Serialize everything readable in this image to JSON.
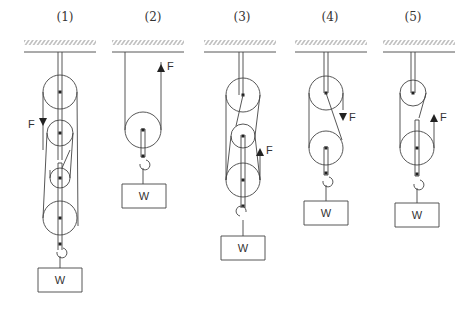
{
  "figure": {
    "type": "pulley-systems",
    "panels": [
      {
        "label": "(1)",
        "force_label": "F",
        "force_direction": "down",
        "weight_label": "W",
        "pulleys": 4
      },
      {
        "label": "(2)",
        "force_label": "F",
        "force_direction": "up",
        "weight_label": "W",
        "pulleys": 1
      },
      {
        "label": "(3)",
        "force_label": "F",
        "force_direction": "up",
        "weight_label": "W",
        "pulleys": 3
      },
      {
        "label": "(4)",
        "force_label": "F",
        "force_direction": "down",
        "weight_label": "W",
        "pulleys": 2
      },
      {
        "label": "(5)",
        "force_label": "F",
        "force_direction": "up",
        "weight_label": "W",
        "pulleys": 2
      }
    ],
    "colors": {
      "line": "#444444",
      "background": "#ffffff"
    }
  }
}
